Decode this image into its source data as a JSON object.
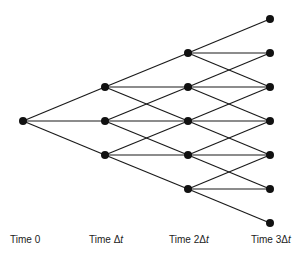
{
  "diagram": {
    "type": "trinomial-tree",
    "colors": {
      "edge": "#1a1a1a",
      "node": "#111111",
      "background": "#ffffff"
    },
    "node_radius": 4,
    "levels": [
      {
        "x": 23,
        "ys": [
          121
        ]
      },
      {
        "x": 105,
        "ys": [
          87,
          121,
          155
        ]
      },
      {
        "x": 188,
        "ys": [
          53,
          87,
          121,
          155,
          189
        ]
      },
      {
        "x": 270,
        "ys": [
          19,
          53,
          87,
          121,
          155,
          189,
          223
        ]
      }
    ],
    "time_labels": [
      {
        "prefix": "Time 0",
        "var": "",
        "x": 10
      },
      {
        "prefix": "Time Δ",
        "var": "t",
        "x": 89
      },
      {
        "prefix": "Time 2Δ",
        "var": "t",
        "x": 169
      },
      {
        "prefix": "Time 3Δ",
        "var": "t",
        "x": 251
      }
    ]
  }
}
